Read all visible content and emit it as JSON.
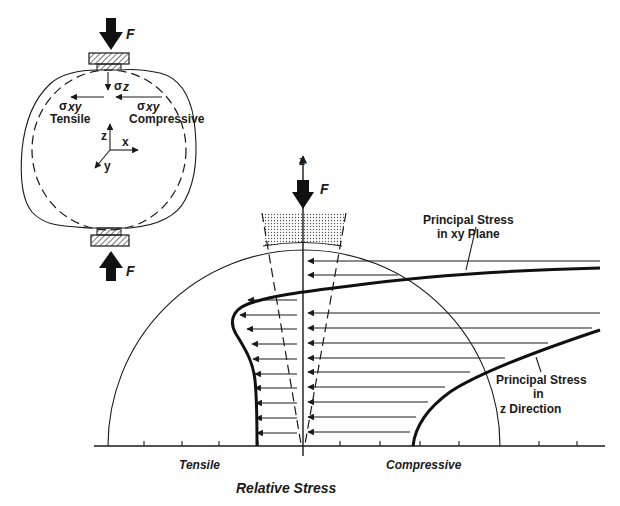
{
  "inset": {
    "force_label_top": "F",
    "force_label_bottom": "F",
    "sigma_z_label": "z",
    "sigma_xy_left_label": "xy",
    "sigma_xy_right_label": "xy",
    "tensile_label": "Tensile",
    "compressive_label": "Compressive",
    "axis_z": "z",
    "axis_x": "x",
    "axis_y": "y"
  },
  "main": {
    "axis_z_label": "z",
    "force_label": "F",
    "curve_xy_label_line1": "Principal Stress",
    "curve_xy_label_line2": "in xy Plane",
    "curve_z_label_line1": "Principal Stress",
    "curve_z_label_line2": "in",
    "curve_z_label_line3": "z Direction",
    "x_left_label": "Tensile",
    "x_right_label": "Compressive",
    "x_axis_title": "Relative Stress"
  },
  "colors": {
    "ink": "#1a1a1a",
    "background": "#ffffff",
    "stipple": "#9a9a9a"
  }
}
